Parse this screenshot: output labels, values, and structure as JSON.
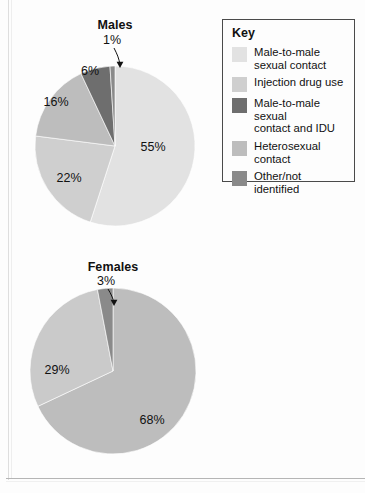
{
  "legend": {
    "title": "Key",
    "items": [
      {
        "label": "Male-to-male\nsexual contact",
        "color": "#e2e2e2",
        "key": "mmsc"
      },
      {
        "label": "Injection drug use",
        "color": "#cfcfcf",
        "key": "idu"
      },
      {
        "label": "Male-to-male sexual\ncontact and IDU",
        "color": "#6e6e6e",
        "key": "mmsc_idu"
      },
      {
        "label": "Heterosexual\ncontact",
        "color": "#bdbdbd",
        "key": "het"
      },
      {
        "label": "Other/not identified",
        "color": "#8a8a8a",
        "key": "other"
      }
    ]
  },
  "charts": {
    "males": {
      "title": "Males"
    },
    "females": {
      "title": "Females"
    }
  },
  "chart_data": [
    {
      "type": "pie",
      "title": "Males",
      "categories": [
        "Male-to-male sexual contact",
        "Injection drug use",
        "Heterosexual contact",
        "Male-to-male sexual contact and IDU",
        "Other/not identified"
      ],
      "values": [
        55,
        22,
        16,
        6,
        1
      ],
      "labels": [
        "55%",
        "22%",
        "16%",
        "6%",
        "1%"
      ],
      "colors": [
        "#e2e2e2",
        "#cfcfcf",
        "#bdbdbd",
        "#6e6e6e",
        "#8a8a8a"
      ],
      "start_angle_deg": 0,
      "direction": "clockwise",
      "units": "percent",
      "legend": "Key",
      "legend_position": "right",
      "callouts": [
        "1%"
      ]
    },
    {
      "type": "pie",
      "title": "Females",
      "categories": [
        "Heterosexual contact",
        "Injection drug use",
        "Other/not identified"
      ],
      "values": [
        68,
        29,
        3
      ],
      "labels": [
        "68%",
        "29%",
        "3%"
      ],
      "colors": [
        "#bdbdbd",
        "#cacaca",
        "#8a8a8a"
      ],
      "start_angle_deg": 0,
      "direction": "clockwise",
      "units": "percent",
      "legend": "Key",
      "legend_position": "right",
      "callouts": [
        "3%"
      ]
    }
  ]
}
